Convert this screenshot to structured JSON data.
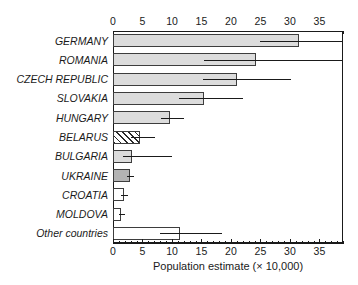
{
  "chart_data": {
    "type": "bar",
    "orientation": "horizontal",
    "title": "",
    "xlabel": "Population estimate (× 10,000)",
    "ylabel": "",
    "xlim": [
      0,
      39
    ],
    "ylim": [
      0,
      11
    ],
    "grid": false,
    "legend": false,
    "x_ticks": [
      0,
      5,
      10,
      15,
      20,
      25,
      30,
      35
    ],
    "x_tick_labels": [
      "0",
      "5",
      "10",
      "15",
      "20",
      "25",
      "30",
      "35"
    ],
    "x_minor_tick_step": 1,
    "axes_positions": [
      "top",
      "bottom"
    ],
    "error_bar_style": "horizontal line, no caps",
    "categories": [
      "GERMANY",
      "ROMANIA",
      "CZECH REPUBLIC",
      "SLOVAKIA",
      "HUNGARY",
      "BELARUS",
      "BULGARIA",
      "UKRAINE",
      "CROATIA",
      "MOLDOVA",
      "Other countries"
    ],
    "values": [
      31.5,
      24.3,
      21.0,
      15.5,
      9.7,
      4.6,
      3.2,
      2.9,
      1.8,
      1.4,
      11.3
    ],
    "error_low": [
      25.0,
      15.5,
      15.2,
      11.2,
      8.2,
      3.1,
      1.7,
      2.3,
      1.3,
      1.0,
      8.0
    ],
    "error_high": [
      39.0,
      39.0,
      30.2,
      22.0,
      12.0,
      7.2,
      10.0,
      3.6,
      2.6,
      2.0,
      18.5
    ],
    "bar_fills": [
      "light-gray",
      "light-gray",
      "light-gray",
      "light-gray",
      "light-gray",
      "hatched",
      "light-gray",
      "dark-gray",
      "white",
      "white",
      "white"
    ],
    "colors": {
      "light_gray": "#dcdcdc",
      "dark_gray": "#b4b4b4",
      "white": "#ffffff",
      "outline": "#3d3d3d",
      "axis": "#1a1a1a"
    }
  }
}
